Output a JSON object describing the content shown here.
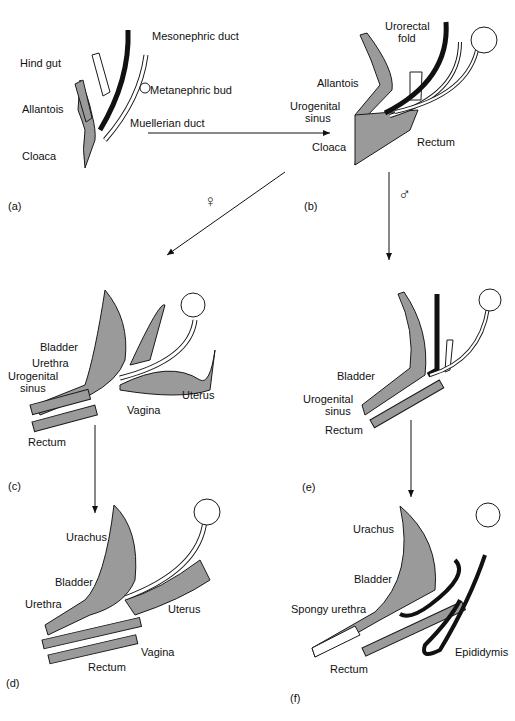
{
  "figure": {
    "panels": [
      {
        "id": "a",
        "label": "(a)",
        "labels": [
          "Mesonephric duct",
          "Hind gut",
          "Metanephric bud",
          "Allantois",
          "Muellerian duct",
          "Cloaca"
        ]
      },
      {
        "id": "b",
        "label": "(b)",
        "labels": [
          "Urorectal",
          "fold",
          "Allantois",
          "Urogenital",
          "sinus",
          "Cloaca",
          "Rectum"
        ]
      },
      {
        "id": "c",
        "label": "(c)",
        "labels": [
          "Bladder",
          "Urethra",
          "Urogenital",
          "sinus",
          "Vagina",
          "Uterus",
          "Rectum"
        ]
      },
      {
        "id": "d",
        "label": "(d)",
        "labels": [
          "Urachus",
          "Bladder",
          "Urethra",
          "Uterus",
          "Vagina",
          "Rectum"
        ]
      },
      {
        "id": "e",
        "label": "(e)",
        "labels": [
          "Bladder",
          "Urogenital",
          "sinus",
          "Rectum"
        ]
      },
      {
        "id": "f",
        "label": "(f)",
        "labels": [
          "Urachus",
          "Bladder",
          "Spongy urethra",
          "Rectum",
          "Epididymis"
        ]
      }
    ],
    "symbols": {
      "female": "♀",
      "male": "♂"
    },
    "colors": {
      "tissue": "#9a9a9a",
      "outline": "#1a1a1a",
      "duct": "#111111",
      "tube": "#ffffff"
    }
  }
}
